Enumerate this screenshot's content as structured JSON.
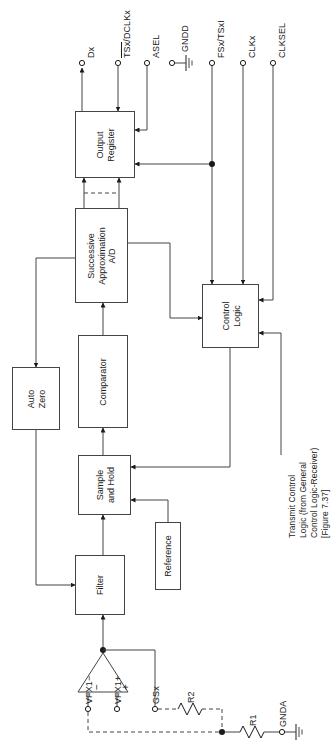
{
  "figure": {
    "orientation": "rotated-90-ccw",
    "line_color": "#444444",
    "text_color": "#1a1a1a",
    "background": "#ffffff"
  },
  "blocks": [
    {
      "id": "output-register",
      "label": "Output\nRegister",
      "line1": "Output",
      "line2": "Register"
    },
    {
      "id": "successive-approximation-ad",
      "label": "Successive\nApproximation\nA/D",
      "line1": "Successive",
      "line2": "Approximation",
      "line3": "A/D"
    },
    {
      "id": "control-logic",
      "label": "Control\nLogic",
      "line1": "Control",
      "line2": "Logic"
    },
    {
      "id": "auto-zero",
      "label": "Auto\nZero",
      "line1": "Auto",
      "line2": "Zero"
    },
    {
      "id": "comparator",
      "label": "Comparator",
      "line1": "Comparator"
    },
    {
      "id": "sample-and-hold",
      "label": "Sample\nand Hold",
      "line1": "Sample",
      "line2": "and Hold"
    },
    {
      "id": "filter",
      "label": "Filter",
      "line1": "Filter"
    },
    {
      "id": "reference",
      "label": "Reference",
      "line1": "Reference"
    }
  ],
  "pins": [
    {
      "id": "dx",
      "label": "Dx",
      "overline": false,
      "direction": "output"
    },
    {
      "id": "tsx-dclkx",
      "label_overlined": "TSx",
      "label_rest": "/DCLKx",
      "overline": true,
      "direction": "input"
    },
    {
      "id": "asel",
      "label": "ASEL",
      "overline": false,
      "direction": "input"
    },
    {
      "id": "gndd",
      "label": "GNDD",
      "overline": false,
      "direction": "ground"
    },
    {
      "id": "fsx-tsxi",
      "label": "FSx/TSxI",
      "overline": false,
      "direction": "input"
    },
    {
      "id": "clkx",
      "label": "CLKx",
      "overline": false,
      "direction": "input"
    },
    {
      "id": "clksel",
      "label": "CLKSEL",
      "overline": false,
      "direction": "input"
    },
    {
      "id": "vfx1-minus",
      "label": "VFX1−",
      "overline": false,
      "direction": "input"
    },
    {
      "id": "vfx1-plus",
      "label": "VFX1+",
      "overline": false,
      "direction": "input"
    },
    {
      "id": "gsx",
      "label": "GSx",
      "overline": false,
      "direction": "input"
    },
    {
      "id": "gnda",
      "label": "GNDA",
      "overline": false,
      "direction": "ground"
    }
  ],
  "components": [
    {
      "id": "r1",
      "label": "R1",
      "type": "resistor"
    },
    {
      "id": "r2",
      "label": "R2",
      "type": "resistor"
    },
    {
      "id": "op-amp",
      "label": "",
      "type": "amplifier",
      "plus": "+",
      "minus": "−"
    }
  ],
  "annotation": {
    "id": "transmit-control-note",
    "line1": "Transmit Control",
    "line2": "Logic (from General",
    "line3": "Control Logic-Receiver)",
    "line4": "[Figure 7.37]"
  },
  "opamp_marks": {
    "minus": "−",
    "plus": "+"
  }
}
